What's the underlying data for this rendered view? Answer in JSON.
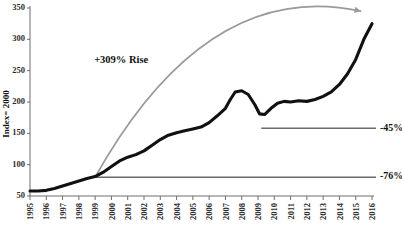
{
  "chart_data": {
    "type": "line",
    "title": "",
    "xlabel": "",
    "ylabel": "Index= 2000",
    "ylim": [
      50,
      350
    ],
    "xlim": [
      1995,
      2016
    ],
    "grid": false,
    "legend": "none",
    "yticks": [
      50,
      100,
      150,
      200,
      250,
      300,
      350
    ],
    "ytick_labels": [
      "50",
      "100",
      "150",
      "200",
      "250",
      "300",
      "350"
    ],
    "xticks": [
      1995,
      1996,
      1997,
      1998,
      1999,
      2000,
      2001,
      2002,
      2003,
      2004,
      2005,
      2006,
      2007,
      2008,
      2009,
      2010,
      2011,
      2012,
      2013,
      2014,
      2015,
      2016
    ],
    "xtick_labels": [
      "1995",
      "1996",
      "1997",
      "1998",
      "1999",
      "2000",
      "2001",
      "2002",
      "2003",
      "2004",
      "2005",
      "2006",
      "2007",
      "2008",
      "2009",
      "2010",
      "2011",
      "2012",
      "2013",
      "2014",
      "2015",
      "2016"
    ],
    "series": [
      {
        "name": "Index",
        "color": "#111111",
        "x": [
          1995.0,
          1995.5,
          1996.0,
          1996.5,
          1997.0,
          1997.5,
          1998.0,
          1998.5,
          1999.0,
          1999.5,
          2000.0,
          2000.5,
          2001.0,
          2001.5,
          2002.0,
          2002.5,
          2003.0,
          2003.5,
          2004.0,
          2004.5,
          2005.0,
          2005.5,
          2006.0,
          2006.5,
          2007.0,
          2007.3,
          2007.6,
          2008.0,
          2008.4,
          2008.8,
          2009.1,
          2009.4,
          2009.8,
          2010.2,
          2010.6,
          2011.0,
          2011.5,
          2012.0,
          2012.5,
          2013.0,
          2013.5,
          2014.0,
          2014.5,
          2015.0,
          2015.5,
          2016.0
        ],
        "y": [
          58,
          58,
          59,
          62,
          66,
          70,
          74,
          78,
          81,
          88,
          97,
          106,
          112,
          116,
          122,
          131,
          140,
          147,
          151,
          154,
          157,
          160,
          167,
          178,
          190,
          204,
          216,
          218,
          212,
          196,
          181,
          180,
          190,
          198,
          201,
          200,
          202,
          201,
          204,
          209,
          216,
          228,
          245,
          268,
          300,
          325
        ]
      }
    ],
    "annotations": [
      {
        "name": "rise-label",
        "text": "+309% Rise",
        "x": 2000.6,
        "y": 263
      },
      {
        "name": "drop-45-label",
        "text": "-45%",
        "x_start": 2009.2,
        "x_end": 2016.3,
        "y": 158
      },
      {
        "name": "drop-76-label",
        "text": "-76%",
        "x_start": 1999.0,
        "x_end": 2016.3,
        "y": 80
      }
    ],
    "trend_arrow": {
      "name": "trend-arrow",
      "color": "#9a9a9a",
      "from_x": 1999.0,
      "from_y": 80,
      "to_x": 2015.3,
      "to_y": 345,
      "style": "curved-arc-with-arrowhead"
    }
  },
  "colors": {
    "series": "#111111",
    "arrow": "#9a9a9a",
    "annotation_line": "#6b6b6b",
    "axis": "#6e6e6e",
    "background": "#ffffff"
  }
}
